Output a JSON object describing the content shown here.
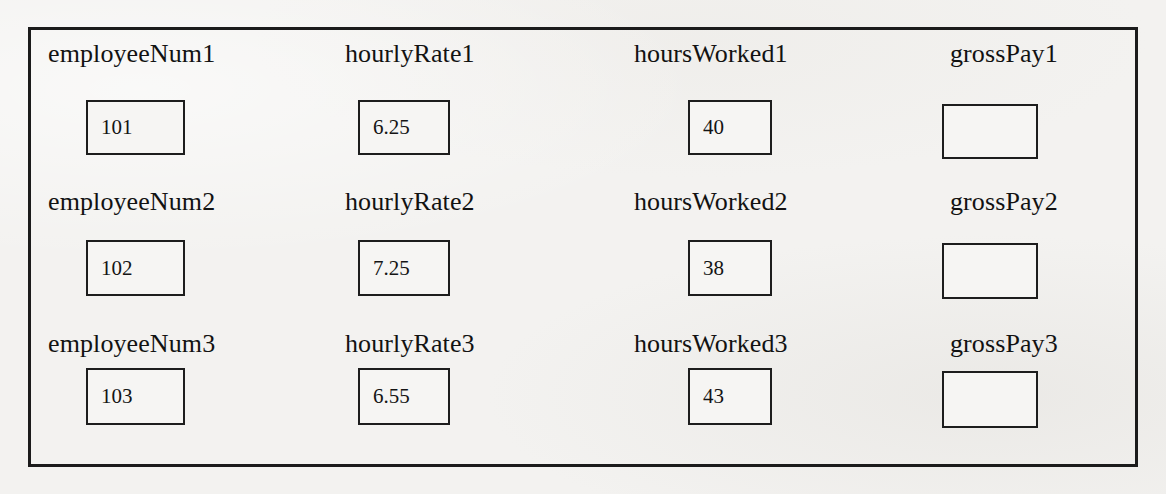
{
  "diagram": {
    "type": "variable-boxes-worksheet",
    "background_color": "#f3f2f0",
    "border_color": "#1b1b1b",
    "text_color": "#121212",
    "rows": [
      {
        "row_index": 1,
        "fields": [
          {
            "label": "employeeNum1",
            "value": "101",
            "empty": false
          },
          {
            "label": "hourlyRate1",
            "value": "6.25",
            "empty": false
          },
          {
            "label": "hoursWorked1",
            "value": "40",
            "empty": false
          },
          {
            "label": "grossPay1",
            "value": "",
            "empty": true
          }
        ]
      },
      {
        "row_index": 2,
        "fields": [
          {
            "label": "employeeNum2",
            "value": "102",
            "empty": false
          },
          {
            "label": "hourlyRate2",
            "value": "7.25",
            "empty": false
          },
          {
            "label": "hoursWorked2",
            "value": "38",
            "empty": false
          },
          {
            "label": "grossPay2",
            "value": "",
            "empty": true
          }
        ]
      },
      {
        "row_index": 3,
        "fields": [
          {
            "label": "employeeNum3",
            "value": "103",
            "empty": false
          },
          {
            "label": "hourlyRate3",
            "value": "6.55",
            "empty": false
          },
          {
            "label": "hoursWorked3",
            "value": "43",
            "empty": false
          },
          {
            "label": "grossPay3",
            "value": "",
            "empty": true
          }
        ]
      }
    ],
    "layout": {
      "label_x": [
        48,
        345,
        634,
        950
      ],
      "box_x": [
        86,
        358,
        688,
        942
      ],
      "box_w": [
        99,
        92,
        84,
        96
      ],
      "label_y": [
        41,
        189,
        331
      ],
      "box_y": [
        100,
        240,
        368
      ],
      "box_h": [
        55,
        56,
        57
      ]
    }
  }
}
